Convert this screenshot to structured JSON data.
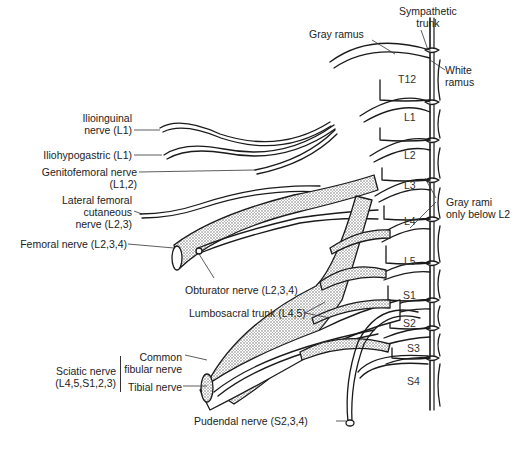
{
  "figure": {
    "type": "anatomical-diagram",
    "colors": {
      "line": "#1a1a1a",
      "fill": "#ffffff",
      "stipple": "#9a9a9a",
      "text": "#222222"
    }
  },
  "labels": {
    "sympathetic_trunk": {
      "line1": "Sympathetic",
      "line2": "trunk"
    },
    "gray_ramus": "Gray ramus",
    "white_ramus": {
      "line1": "White",
      "line2": "ramus"
    },
    "gray_rami_below": {
      "line1": "Gray rami",
      "line2": "only below L2"
    },
    "ilioinguinal": {
      "line1": "Ilioinguinal",
      "line2": "nerve (L1)"
    },
    "iliohypogastric": "Iliohypogastric (L1)",
    "genitofemoral": {
      "line1": "Genitofemoral nerve",
      "line2": "(L1,2)"
    },
    "lateral_femoral_cutaneous": {
      "line1": "Lateral femoral",
      "line2": "cutaneous",
      "line3": "nerve (L2,3)"
    },
    "femoral": "Femoral nerve (L2,3,4)",
    "obturator": "Obturator nerve (L2,3,4)",
    "lumbosacral_trunk": "Lumbosacral trunk (L4,5)",
    "sciatic": {
      "line1": "Sciatic nerve",
      "line2": "(L4,5,S1,2,3)"
    },
    "common_fibular": {
      "line1": "Common",
      "line2": "fibular nerve"
    },
    "tibial": "Tibial nerve",
    "pudendal": "Pudendal nerve (S2,3,4)"
  },
  "segments": [
    "T12",
    "L1",
    "L2",
    "L3",
    "L4",
    "L5",
    "S1",
    "S2",
    "S3",
    "S4"
  ]
}
